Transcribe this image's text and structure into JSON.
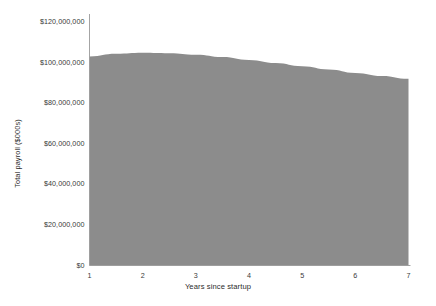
{
  "chart_data": {
    "type": "area",
    "title": "",
    "xlabel": "Years since startup",
    "ylabel": "Total payroll ($000s)",
    "x": [
      1,
      1.5,
      2,
      2.5,
      3,
      3.5,
      4,
      4.5,
      5,
      5.5,
      6,
      6.5,
      7
    ],
    "values": [
      103000000,
      104300000,
      104800000,
      104600000,
      103800000,
      102700000,
      101300000,
      99800000,
      98200000,
      96600000,
      94900000,
      93400000,
      92000000
    ],
    "series": [
      {
        "name": "Total payroll",
        "values": [
          103000000,
          104300000,
          104800000,
          104600000,
          103800000,
          102700000,
          101300000,
          99800000,
          98200000,
          96600000,
          94900000,
          93400000,
          92000000
        ]
      }
    ],
    "xlim": [
      1,
      7
    ],
    "ylim": [
      0,
      120000000
    ],
    "xticks": [
      1,
      2,
      3,
      4,
      5,
      6,
      7
    ],
    "xtick_labels": [
      "1",
      "2",
      "3",
      "4",
      "5",
      "6",
      "7"
    ],
    "yticks": [
      0,
      20000000,
      40000000,
      60000000,
      80000000,
      100000000,
      120000000
    ],
    "ytick_labels": [
      "$0",
      "$20,000,000",
      "$40,000,000",
      "$60,000,000",
      "$80,000,000",
      "$100,000,000",
      "$120,000,000"
    ],
    "grid": false,
    "legend": false,
    "legend_position": "none",
    "area_color": "#8c8c8c",
    "axis_color": "#9a9a9a",
    "background_color": "#ffffff",
    "text_color": "#3a3a3a"
  }
}
